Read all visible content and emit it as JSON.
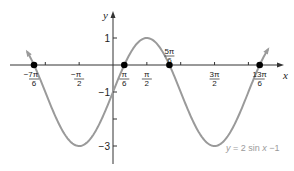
{
  "chart_data": {
    "type": "line",
    "title": "",
    "function": "y = 2 sin x - 1",
    "amplitude": 2,
    "vertical_shift": -1,
    "xlabel": "x",
    "ylabel": "y",
    "xlim_radians": [
      -3.97,
      7.18
    ],
    "ylim": [
      -3.5,
      1.9
    ],
    "grid": false,
    "series": [
      {
        "name": "y = 2 sin x −1",
        "color": "#9a9a9a",
        "x_start": -3.97,
        "x_end": 7.18,
        "arrows_both_ends": true
      }
    ],
    "x_ticks": [
      {
        "value_pi": -1.1667,
        "label_num": "−7π",
        "label_den": "6",
        "labeled": true
      },
      {
        "value_pi": -1.0,
        "labeled": false
      },
      {
        "value_pi": -0.5,
        "label_num": "−π",
        "label_den": "2",
        "labeled": true
      },
      {
        "value_pi": 0.1667,
        "label_num": "π",
        "label_den": "6",
        "labeled": true
      },
      {
        "value_pi": 0.5,
        "label_num": "π",
        "label_den": "2",
        "labeled": true
      },
      {
        "value_pi": 0.8333,
        "label_num": "5π",
        "label_den": "6",
        "labeled": true,
        "above": true
      },
      {
        "value_pi": 1.0,
        "labeled": false
      },
      {
        "value_pi": 1.5,
        "label_num": "3π",
        "label_den": "2",
        "labeled": true
      },
      {
        "value_pi": 2.0,
        "labeled": false
      },
      {
        "value_pi": 2.1667,
        "label_num": "13π",
        "label_den": "6",
        "labeled": true
      }
    ],
    "y_ticks": [
      {
        "value": 1,
        "label": "1"
      },
      {
        "value": -1,
        "label": "−1"
      },
      {
        "value": -2,
        "label": ""
      },
      {
        "value": -3,
        "label": "−3"
      }
    ],
    "points_marked": [
      {
        "x_pi": -1.1667,
        "y": 0,
        "label": "−7π/6"
      },
      {
        "x_pi": 0.1667,
        "y": 0,
        "label": "π/6"
      },
      {
        "x_pi": 0.8333,
        "y": 0,
        "label": "5π/6"
      },
      {
        "x_pi": 2.1667,
        "y": 0,
        "label": "13π/6"
      }
    ],
    "extrema": [
      {
        "x_pi": -0.5,
        "y": -3,
        "type": "min"
      },
      {
        "x_pi": 0.5,
        "y": 1,
        "type": "max"
      },
      {
        "x_pi": 1.5,
        "y": -3,
        "type": "min"
      }
    ],
    "annotation": {
      "text_parts": [
        "y",
        " = 2 sin ",
        "x",
        " −1"
      ]
    }
  },
  "layout": {
    "origin_px": [
      113,
      65
    ],
    "px_per_radian": 21.55,
    "px_per_unit_y": 27,
    "x_axis_px": [
      10,
      284
    ],
    "y_axis_px": [
      164,
      11
    ],
    "curve_color": "#9a9a9a",
    "axis_color": "#333333",
    "dot_color": "#000000"
  }
}
